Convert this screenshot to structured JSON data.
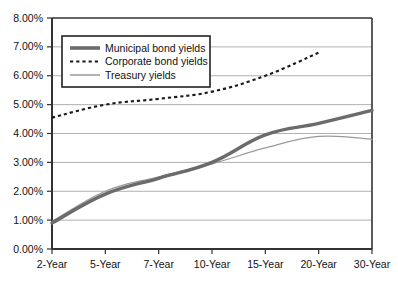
{
  "chart_data": {
    "type": "line",
    "title": "",
    "subtitle": "",
    "xlabel": "",
    "ylabel": "",
    "categories": [
      "2-Year",
      "5-Year",
      "7-Year",
      "10-Year",
      "15-Year",
      "20-Year",
      "30-Year"
    ],
    "ylim": [
      0,
      8
    ],
    "ytick_labels": [
      "0.00%",
      "1.00%",
      "2.00%",
      "3.00%",
      "4.00%",
      "5.00%",
      "6.00%",
      "7.00%",
      "8.00%"
    ],
    "ytick_values": [
      0,
      1,
      2,
      3,
      4,
      5,
      6,
      7,
      8
    ],
    "grid": "horizontal",
    "legend_position": "top-left-inside",
    "series": [
      {
        "name": "Municipal bond yields",
        "style": "solid-thick",
        "color": "#6b6b6b",
        "values": [
          0.9,
          1.9,
          2.45,
          3.0,
          3.95,
          4.35,
          4.8
        ]
      },
      {
        "name": "Corporate bond yields",
        "style": "dashed",
        "color": "#1a1a1a",
        "values": [
          4.55,
          5.0,
          5.2,
          5.45,
          6.0,
          6.8,
          null
        ]
      },
      {
        "name": "Treasury yields",
        "style": "solid-thin",
        "color": "#9a9a9a",
        "values": [
          0.95,
          2.0,
          2.5,
          2.95,
          3.5,
          3.9,
          3.8
        ]
      }
    ]
  },
  "legend": {
    "items": [
      {
        "label": "Municipal bond yields"
      },
      {
        "label": "Corporate bond yields"
      },
      {
        "label": "Treasury yields"
      }
    ]
  },
  "axes": {
    "y_labels": [
      "8.00%",
      "7.00%",
      "6.00%",
      "5.00%",
      "4.00%",
      "3.00%",
      "2.00%",
      "1.00%",
      "0.00%"
    ],
    "x_labels": [
      "2-Year",
      "5-Year",
      "7-Year",
      "10-Year",
      "15-Year",
      "20-Year",
      "30-Year"
    ]
  },
  "colors": {
    "municipal": "#6b6b6b",
    "corporate": "#1a1a1a",
    "treasury": "#9a9a9a",
    "grid": "#b0b0b0",
    "axis": "#333333",
    "background": "#ffffff"
  }
}
